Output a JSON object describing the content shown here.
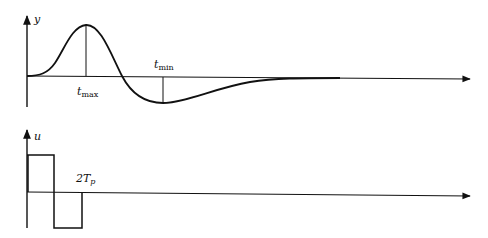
{
  "top_panel": {
    "axis_label": "y",
    "peak_label": {
      "main": "t",
      "sub": "max"
    },
    "trough_label": {
      "main": "t",
      "sub": "min"
    },
    "curve_description": "Response y rises from zero to a positive maximum at t_max, crosses zero, dips to a negative minimum at t_min, then decays back to zero"
  },
  "bottom_panel": {
    "axis_label": "u",
    "pulse_end_label": {
      "main": "2T",
      "sub": "p"
    },
    "signal_description": "Doublet input u: positive rectangular pulse for duration T_p, then negative pulse of equal magnitude until 2T_p, then zero"
  },
  "colors": {
    "stroke": "#111111",
    "background": "#ffffff"
  }
}
